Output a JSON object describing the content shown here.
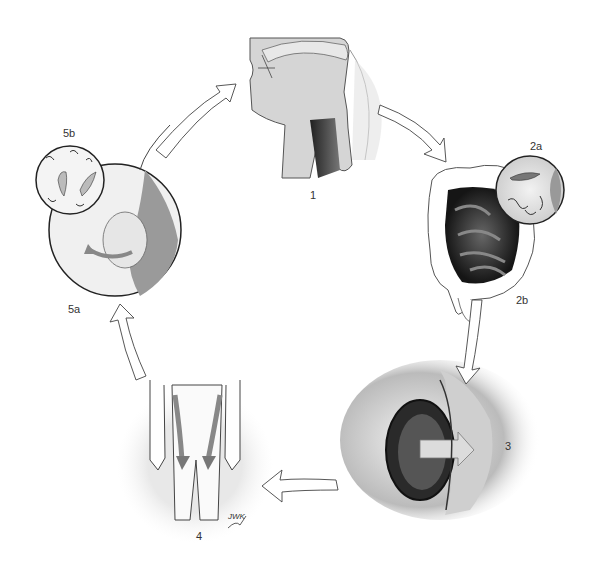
{
  "diagram": {
    "type": "cycle",
    "title": "",
    "stages": [
      {
        "id": "1",
        "label": "1",
        "depicts": "head and throat cross-section (mouth, pharynx, esophagus)"
      },
      {
        "id": "2a",
        "label": "2a",
        "depicts": "magnified inset of larva and worms"
      },
      {
        "id": "2b",
        "label": "2b",
        "depicts": "abdomen with small and large intestine"
      },
      {
        "id": "3",
        "label": "3",
        "depicts": "intestinal wall penetration with arrow"
      },
      {
        "id": "4",
        "label": "4",
        "depicts": "legs with downward arrows"
      },
      {
        "id": "5a",
        "label": "5a",
        "depicts": "magnified tissue with cyst and curved arrow"
      },
      {
        "id": "5b",
        "label": "5b",
        "depicts": "magnified inset of larvae"
      }
    ],
    "flow": [
      "1",
      "2",
      "3",
      "4",
      "5",
      "1"
    ],
    "signature": "JWK"
  },
  "colors": {
    "background": "#ffffff",
    "line": "#333333",
    "tissue_light": "#d8d8d8",
    "tissue_mid": "#a0a0a0",
    "tissue_dark": "#3a3a3a",
    "disc": "#e6e6e6"
  }
}
